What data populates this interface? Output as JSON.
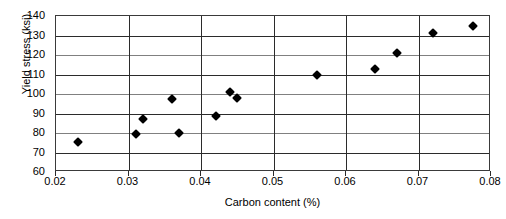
{
  "chart_data": {
    "type": "scatter",
    "title": "",
    "xlabel": "Carbon content (%)",
    "ylabel": "Yield stress (ksi)",
    "xlim": [
      0.02,
      0.08
    ],
    "ylim": [
      60,
      140
    ],
    "xticks": [
      "0.02",
      "0.03",
      "0.04",
      "0.05",
      "0.06",
      "0.07",
      "0.08"
    ],
    "xtick_values": [
      0.02,
      0.03,
      0.04,
      0.05,
      0.06,
      0.07,
      0.08
    ],
    "yticks": [
      "60",
      "70",
      "80",
      "90",
      "100",
      "110",
      "120",
      "130",
      "140"
    ],
    "ytick_values": [
      60,
      70,
      80,
      90,
      100,
      110,
      120,
      130,
      140
    ],
    "grid": "horizontal-and-vertical",
    "legend": null,
    "marker": "filled-diamond",
    "marker_color": "#000000",
    "series": [
      {
        "name": "Yield stress vs carbon content",
        "x": [
          0.023,
          0.031,
          0.032,
          0.036,
          0.037,
          0.042,
          0.044,
          0.045,
          0.056,
          0.064,
          0.067,
          0.072,
          0.0775
        ],
        "y": [
          75.5,
          79.5,
          87.0,
          97.5,
          80.0,
          88.5,
          101.0,
          98.0,
          110.0,
          113.0,
          121.0,
          131.5,
          135.0
        ]
      }
    ]
  }
}
